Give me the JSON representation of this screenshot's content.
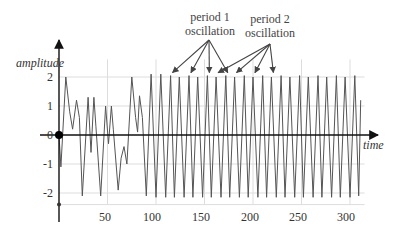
{
  "chart_data": {
    "type": "line",
    "title": "",
    "xlabel": "time",
    "ylabel": "amplitude",
    "xlim": [
      0,
      315
    ],
    "ylim": [
      -2.4,
      2.4
    ],
    "x_ticks": [
      50,
      100,
      150,
      200,
      250,
      300
    ],
    "y_ticks": [
      2,
      1,
      0,
      -1,
      -2
    ],
    "grid": true,
    "annotations": [
      {
        "text": "period 1\noscillation",
        "line1": "period 1",
        "line2": "oscillation",
        "arrow_targets_t": [
          117,
          136,
          155,
          174
        ]
      },
      {
        "text": "period 2\noscillation",
        "line1": "period 2",
        "line2": "oscillation",
        "arrow_targets_t": [
          164,
          183,
          202,
          221
        ]
      }
    ],
    "origin_marker": {
      "t": 0,
      "amplitude": 0
    },
    "series": [
      {
        "name": "amplitude",
        "color": "#555555",
        "points": [
          [
            0,
            0
          ],
          [
            2,
            -1.1
          ],
          [
            7,
            2.0
          ],
          [
            11,
            0.8
          ],
          [
            14,
            0.2
          ],
          [
            18,
            1.2
          ],
          [
            21,
            0.6
          ],
          [
            24,
            -2.1
          ],
          [
            30,
            1.3
          ],
          [
            33,
            -0.6
          ],
          [
            36,
            1.3
          ],
          [
            38,
            0.3
          ],
          [
            43,
            -2.1
          ],
          [
            48,
            1.0
          ],
          [
            51,
            -0.3
          ],
          [
            54,
            1.0
          ],
          [
            56,
            0.2
          ],
          [
            61,
            -1.9
          ],
          [
            64,
            -0.8
          ],
          [
            67,
            -0.4
          ],
          [
            70,
            -1.0
          ],
          [
            75,
            2.0
          ],
          [
            79,
            0.6
          ],
          [
            81,
            0.1
          ],
          [
            83,
            1.35
          ],
          [
            86,
            0.6
          ],
          [
            90,
            -2.1
          ],
          [
            95,
            2.1
          ],
          [
            100,
            -2.15
          ],
          [
            105,
            2.1
          ],
          [
            110,
            -2.15
          ],
          [
            115,
            2.05
          ],
          [
            119,
            -2.15
          ],
          [
            124,
            2.0
          ],
          [
            129,
            -2.15
          ],
          [
            134,
            2.05
          ],
          [
            138,
            -2.15
          ],
          [
            143,
            2.0
          ],
          [
            148,
            -2.15
          ],
          [
            153,
            2.05
          ],
          [
            157,
            -2.15
          ],
          [
            162,
            2.0
          ],
          [
            167,
            -2.15
          ],
          [
            172,
            2.05
          ],
          [
            176,
            -2.15
          ],
          [
            181,
            2.0
          ],
          [
            186,
            -2.15
          ],
          [
            191,
            2.05
          ],
          [
            195,
            -2.15
          ],
          [
            200,
            2.0
          ],
          [
            205,
            -2.15
          ],
          [
            210,
            2.05
          ],
          [
            214,
            -2.15
          ],
          [
            219,
            2.0
          ],
          [
            224,
            -2.15
          ],
          [
            229,
            2.05
          ],
          [
            233,
            -2.15
          ],
          [
            238,
            2.0
          ],
          [
            243,
            -2.15
          ],
          [
            248,
            2.05
          ],
          [
            252,
            -2.15
          ],
          [
            257,
            2.0
          ],
          [
            262,
            -2.15
          ],
          [
            267,
            2.05
          ],
          [
            271,
            -2.15
          ],
          [
            276,
            2.0
          ],
          [
            281,
            -2.15
          ],
          [
            286,
            2.05
          ],
          [
            290,
            -2.15
          ],
          [
            295,
            2.0
          ],
          [
            300,
            -2.15
          ],
          [
            305,
            2.05
          ],
          [
            309,
            -2.1
          ],
          [
            311,
            1.2
          ]
        ]
      }
    ]
  },
  "axes": {
    "y_label": "amplitude",
    "x_label": "time",
    "y_tick_labels": [
      "2",
      "1",
      "0",
      "-1",
      "-2"
    ],
    "x_tick_labels": [
      "50",
      "100",
      "150",
      "200",
      "250",
      "300"
    ]
  },
  "annotations": {
    "period1": {
      "line1": "period 1",
      "line2": "oscillation"
    },
    "period2": {
      "line1": "period 2",
      "line2": "oscillation"
    }
  },
  "colors": {
    "axis": "#111111",
    "grid": "#dddddd",
    "line": "#555555",
    "arrow": "#444444",
    "text": "#333333"
  }
}
